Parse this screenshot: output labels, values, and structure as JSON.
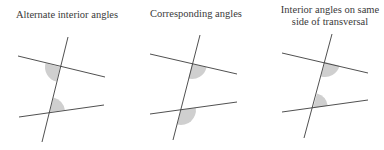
{
  "diagrams": [
    {
      "title": "Alternate interior angles",
      "center_x": 66,
      "transversal": [
        68,
        37,
        42,
        142
      ],
      "line_top": [
        18,
        56,
        105,
        77
      ],
      "line_bottom": [
        19,
        117,
        104,
        105
      ],
      "sectors": [
        "M60,67 L45.5,63.2 A15,15 0 0 0 56.5,81.6 Z",
        "M50,112 L53.5,97.4 A15,15 0 0 1 64.9,110.1 Z"
      ]
    },
    {
      "title": "Corresponding angles",
      "center_x": 196,
      "transversal": [
        200,
        35,
        173,
        140
      ],
      "line_top": [
        150,
        54,
        237,
        74
      ],
      "line_bottom": [
        150,
        114,
        237,
        102
      ],
      "sectors": [
        "M192,64 L206.6,67.3 A15,15 0 0 1 188.4,78.6 Z",
        "M181,110 L195.8,107.9 A15,15 0 0 1 177.4,124.6 Z"
      ]
    },
    {
      "title": "Interior angles on same side of transversal",
      "title_lines": [
        "Interior angles on same",
        "side of transversal"
      ],
      "center_x": 330,
      "transversal": [
        332,
        34,
        304,
        138
      ],
      "line_top": [
        282,
        53,
        368,
        73
      ],
      "line_bottom": [
        282,
        112,
        368,
        100
      ],
      "sectors": [
        "M325,62 L339.5,65.7 A15,15 0 0 1 321,76.5 Z",
        "M313,108 L317,93.5 A15,15 0 0 1 327.8,105.8 Z"
      ]
    }
  ],
  "colors": {
    "line": "#3c3c3c",
    "shade": "#cfcfcf",
    "text": "#3a3a3a"
  }
}
